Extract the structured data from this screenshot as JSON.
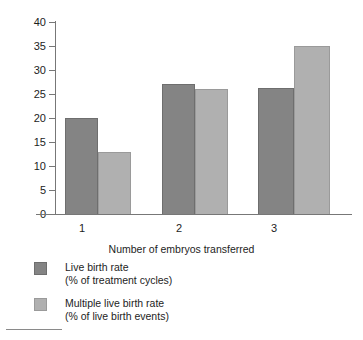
{
  "chart_data": {
    "type": "bar",
    "title": "",
    "xlabel": "Number of embryos transferred",
    "ylabel": "",
    "categories": [
      "1",
      "2",
      "3"
    ],
    "ylim": [
      0,
      40
    ],
    "yticks": [
      0,
      5,
      10,
      15,
      20,
      25,
      30,
      35,
      40
    ],
    "ytick_labels": [
      "0",
      "5",
      "10",
      "15",
      "20",
      "25",
      "30",
      "35",
      "40"
    ],
    "grid": false,
    "legend_position": "below-left",
    "series": [
      {
        "name": "Live birth rate",
        "sublabel": "(% of treatment cycles)",
        "color": "#848484",
        "values": [
          20,
          27,
          26.3
        ]
      },
      {
        "name": "Multiple live birth rate",
        "sublabel": "(% of live birth events)",
        "color": "#b0b0b0",
        "values": [
          13,
          26,
          35
        ]
      }
    ]
  },
  "axes": {
    "x_title": "Number of embryos transferred",
    "x_tick_labels": [
      "1",
      "2",
      "3"
    ],
    "y_tick_labels": [
      "40",
      "35",
      "30",
      "25",
      "20",
      "15",
      "10",
      "5",
      "0"
    ]
  },
  "legend": {
    "items": [
      {
        "label": "Live birth rate",
        "sublabel": "(% of treatment cycles)",
        "swatch": "series-dark"
      },
      {
        "label": "Multiple live birth rate",
        "sublabel": "(% of live birth events)",
        "swatch": "series-light"
      }
    ]
  },
  "colors": {
    "series_dark": "#848484",
    "series_light": "#b0b0b0",
    "axis": "#777777",
    "text": "#1d1d1d"
  }
}
